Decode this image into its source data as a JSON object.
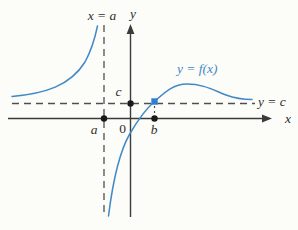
{
  "figure": {
    "background": "#fcfcf9",
    "colors": {
      "curve": "#4189c7",
      "curve_label": "#4189c7",
      "axis": "#3b3b3b",
      "dashed": "#4f4f4f",
      "text": "#2e2e2e",
      "point": "#1a1a1a",
      "point_highlight": "#2f7fd0"
    },
    "labels": {
      "vertical_asymptote": "x = a",
      "horizontal_asymptote": "y = c",
      "curve": "y = f(x)",
      "y_axis": "y",
      "x_axis": "x",
      "c": "c",
      "origin": "0",
      "a": "a",
      "b": "b"
    },
    "paths": {
      "x_axis": "M 8 118.5 H 264",
      "y_axis": "M 130.5 32 V 217",
      "x_arrow": "272,118.5 262,114.6 262,122.4",
      "y_arrow": "130.5,24 126.6,34 134.4,34",
      "v_asymptote": "M 104 25 V 212",
      "h_asymptote": "M 12 103.5 H 255",
      "left_branch": "M 12 96.5 C 45 93.5 70 86 85 62 C 91 51 95 38 97.5 26",
      "right_branch": "M 108.5 216 C 112 188 118 154 130 133.5 C 139 118 146 109 154.5 101.5 C 163 94 172 84 187 84 C 203 84 213 90 226 95 C 236 98.7 246 99.5 252 99.5",
      "b_connector": "M 154.5 106 V 114"
    },
    "points": {
      "a_dot": {
        "x": 104,
        "y": 118.5,
        "r": 3.2
      },
      "c_dot": {
        "x": 130.5,
        "y": 103.5,
        "r": 3.2
      },
      "b_dot": {
        "x": 154.5,
        "y": 118.5,
        "r": 3.2
      },
      "bc_dot": {
        "x": 151.3,
        "y": 98.3,
        "size": 6.4
      }
    }
  }
}
